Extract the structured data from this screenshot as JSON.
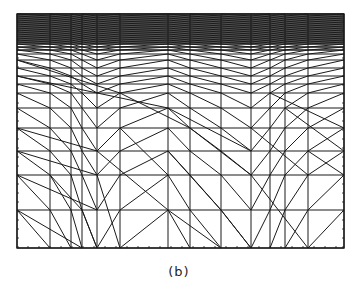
{
  "figure": {
    "caption": "(b)",
    "type": "finite-element triangular mesh",
    "line_color": "#1a1a1a",
    "background": "#ffffff"
  },
  "mesh": {
    "frame": {
      "x0": 17,
      "y0": 14,
      "x1": 344,
      "y1": 248
    },
    "vertical_lines_x": [
      17,
      50,
      71,
      82,
      97,
      120,
      168,
      190,
      221,
      251,
      270,
      285,
      308,
      344
    ],
    "horizontal_lines_y": [
      14,
      16,
      18,
      20,
      22,
      24,
      26,
      28,
      30,
      32,
      34,
      36,
      38,
      40,
      42,
      44,
      47,
      50,
      54,
      60,
      68,
      76,
      84,
      93,
      108,
      128,
      151,
      175,
      210,
      248
    ],
    "focus_points_x": [
      97,
      248
    ],
    "focus_y": 50
  }
}
